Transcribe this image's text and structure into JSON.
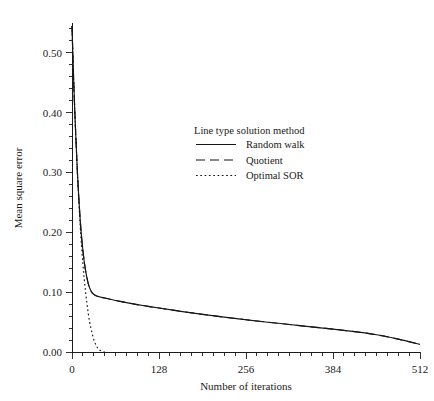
{
  "chart_data": {
    "type": "line",
    "title": "",
    "xlabel": "Number of iterations",
    "ylabel": "Mean square error",
    "xlim": [
      0,
      512
    ],
    "ylim": [
      0.0,
      0.55
    ],
    "grid": false,
    "xticks": [
      0,
      128,
      256,
      384,
      512
    ],
    "xticklabels": [
      "0",
      "128",
      "256",
      "384",
      "512"
    ],
    "yticks": [
      0.0,
      0.1,
      0.2,
      0.3,
      0.4,
      0.5
    ],
    "yticklabels": [
      "0.00",
      "0.10",
      "0.20",
      "0.30",
      "0.40",
      "0.50"
    ],
    "xminor_step": 16,
    "yminor_step": 0.02,
    "legend": {
      "title": "Line type solution method",
      "position": "upper-center",
      "entries": [
        {
          "label": "Random walk",
          "linestyle": "solid"
        },
        {
          "label": "Quotient",
          "linestyle": "dashed"
        },
        {
          "label": "Optimal SOR",
          "linestyle": "dotted"
        }
      ]
    },
    "series": [
      {
        "name": "Random walk",
        "linestyle": "solid",
        "x": [
          0,
          2,
          4,
          6,
          8,
          10,
          12,
          14,
          16,
          18,
          20,
          22,
          24,
          26,
          28,
          30,
          34,
          38,
          42,
          48,
          56,
          64,
          80,
          96,
          112,
          128,
          160,
          192,
          224,
          256,
          288,
          320,
          352,
          384,
          416,
          448,
          480,
          512
        ],
        "y": [
          0.545,
          0.47,
          0.405,
          0.35,
          0.3,
          0.258,
          0.222,
          0.193,
          0.17,
          0.151,
          0.136,
          0.124,
          0.114,
          0.107,
          0.102,
          0.0985,
          0.0948,
          0.093,
          0.0918,
          0.0903,
          0.0882,
          0.0862,
          0.0826,
          0.0793,
          0.0763,
          0.0735,
          0.068,
          0.063,
          0.0583,
          0.054,
          0.0498,
          0.046,
          0.042,
          0.0383,
          0.034,
          0.0288,
          0.0215,
          0.0128
        ]
      },
      {
        "name": "Quotient",
        "linestyle": "dashed",
        "x": [
          0,
          2,
          4,
          6,
          8,
          10,
          12,
          14,
          16,
          18,
          20,
          22,
          24,
          26,
          28,
          30,
          34,
          38,
          42,
          48,
          56,
          64,
          80,
          96,
          112,
          128,
          160,
          192,
          224,
          256,
          288,
          320,
          352,
          384,
          416,
          448,
          480,
          512
        ],
        "y": [
          0.545,
          0.47,
          0.405,
          0.35,
          0.3,
          0.258,
          0.222,
          0.193,
          0.17,
          0.151,
          0.136,
          0.124,
          0.114,
          0.107,
          0.102,
          0.0985,
          0.0948,
          0.093,
          0.0918,
          0.0903,
          0.0882,
          0.0862,
          0.0826,
          0.0793,
          0.0763,
          0.0735,
          0.068,
          0.063,
          0.0583,
          0.054,
          0.0498,
          0.046,
          0.042,
          0.0383,
          0.034,
          0.0288,
          0.0215,
          0.0128
        ]
      },
      {
        "name": "Optimal SOR",
        "linestyle": "dotted",
        "x": [
          0,
          2,
          4,
          6,
          8,
          10,
          12,
          14,
          16,
          18,
          20,
          22,
          24,
          26,
          28,
          30,
          32,
          34,
          36,
          38,
          40,
          42,
          44,
          46,
          48
        ],
        "y": [
          0.545,
          0.47,
          0.405,
          0.35,
          0.298,
          0.252,
          0.212,
          0.178,
          0.148,
          0.122,
          0.1,
          0.081,
          0.064,
          0.05,
          0.039,
          0.029,
          0.021,
          0.0148,
          0.01,
          0.0065,
          0.004,
          0.0024,
          0.0013,
          0.0006,
          0.0002
        ]
      }
    ]
  },
  "axes_geometry": {
    "plot_left_px": 72,
    "plot_right_px": 420,
    "plot_bottom_px": 352,
    "plot_top_px": 23
  }
}
